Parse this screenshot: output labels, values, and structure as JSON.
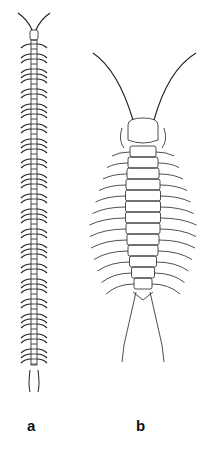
{
  "figure": {
    "panels": [
      {
        "label": "a",
        "subject": "long slender centipede-like arthropod, dorsal view, many leg pairs"
      },
      {
        "label": "b",
        "subject": "short broad centipede-like arthropod, dorsal view, long antennae, ~15 leg pairs"
      }
    ],
    "colors": {
      "ink": "#222222",
      "background": "#ffffff"
    }
  }
}
